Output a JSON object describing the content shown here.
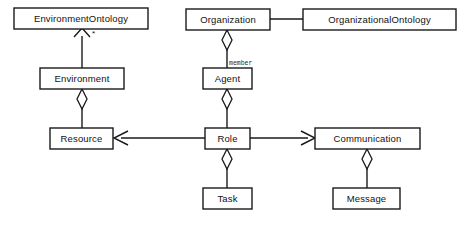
{
  "diagram": {
    "type": "uml-class-diagram",
    "title": "",
    "background_color": "#ffffff",
    "line_color": "#1a1a1a",
    "box_fill": "#ffffff",
    "classes": [
      {
        "id": "environment_ontology",
        "label": "EnvironmentOntology",
        "x": 14,
        "y": 8,
        "w": 134,
        "h": 21
      },
      {
        "id": "organization",
        "label": "Organization",
        "x": 186,
        "y": 9,
        "w": 84,
        "h": 21
      },
      {
        "id": "organizational_ontology",
        "label": "OrganizationalOntology",
        "x": 303,
        "y": 9,
        "w": 153,
        "h": 21
      },
      {
        "id": "environment",
        "label": "Environment",
        "x": 40,
        "y": 68,
        "w": 84,
        "h": 21
      },
      {
        "id": "agent",
        "label": "Agent",
        "x": 203,
        "y": 68,
        "w": 49,
        "h": 21
      },
      {
        "id": "resource",
        "label": "Resource",
        "x": 50,
        "y": 128,
        "w": 63,
        "h": 21
      },
      {
        "id": "role",
        "label": "Role",
        "x": 205,
        "y": 128,
        "w": 45,
        "h": 21
      },
      {
        "id": "communication",
        "label": "Communication",
        "x": 315,
        "y": 128,
        "w": 105,
        "h": 21
      },
      {
        "id": "task",
        "label": "Task",
        "x": 203,
        "y": 188,
        "w": 49,
        "h": 21
      },
      {
        "id": "message",
        "label": "Message",
        "x": 333,
        "y": 188,
        "w": 67,
        "h": 21
      }
    ],
    "relationships": [
      {
        "id": "environment-to-environmentontology",
        "from": "environment",
        "to": "environment_ontology",
        "kind": "generalization",
        "multiplicity": "*"
      },
      {
        "id": "environment-aggregates-resource",
        "from": "environment",
        "to": "resource",
        "kind": "aggregation",
        "multiplicity": ""
      },
      {
        "id": "organization-aggregates-agent",
        "from": "organization",
        "to": "agent",
        "kind": "aggregation",
        "role_label": "member"
      },
      {
        "id": "organization-to-organizationalontology",
        "from": "organization",
        "to": "organizational_ontology",
        "kind": "association",
        "multiplicity": ""
      },
      {
        "id": "agent-aggregates-role",
        "from": "agent",
        "to": "role",
        "kind": "aggregation",
        "multiplicity": ""
      },
      {
        "id": "role-uses-resource",
        "from": "role",
        "to": "resource",
        "kind": "directed-association",
        "multiplicity": ""
      },
      {
        "id": "role-uses-communication",
        "from": "role",
        "to": "communication",
        "kind": "directed-association",
        "multiplicity": ""
      },
      {
        "id": "role-aggregates-task",
        "from": "role",
        "to": "task",
        "kind": "aggregation",
        "multiplicity": ""
      },
      {
        "id": "communication-aggregates-message",
        "from": "communication",
        "to": "message",
        "kind": "aggregation",
        "multiplicity": ""
      }
    ],
    "annotations": {
      "member_role": "member",
      "star_multiplicity": "*"
    }
  }
}
